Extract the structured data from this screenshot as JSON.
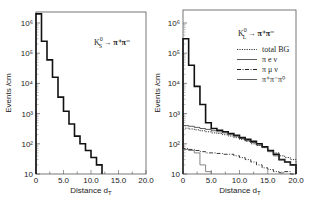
{
  "chart_data": [
    {
      "type": "bar",
      "style": "step-histogram",
      "title": "K_S^0 → π+π−",
      "xlabel": "Distance d_T",
      "ylabel": "Events /cm",
      "yscale": "log",
      "xlim": [
        0,
        20.0
      ],
      "ylim": [
        10,
        2000000
      ],
      "xticks": [
        "0",
        "5.0",
        "10.0",
        "15.0",
        "20.0"
      ],
      "yticks": [
        "10",
        "10^2",
        "10^3",
        "10^4",
        "10^5",
        "10^6"
      ],
      "bin_width": 1.0,
      "series": [
        {
          "name": "K_S^0 → π+π−",
          "style": "thick-solid",
          "x": [
            0,
            1,
            2,
            3,
            4,
            5,
            6,
            7,
            8,
            9,
            10,
            11
          ],
          "values": [
            2000000,
            250000,
            60000,
            16000,
            3500,
            1200,
            450,
            180,
            100,
            60,
            35,
            20
          ]
        }
      ],
      "legend": [],
      "grid": false
    },
    {
      "type": "bar",
      "style": "step-histogram",
      "title": "K_L^0 → π+π−",
      "xlabel": "Distance d_T",
      "ylabel": "Events /cm",
      "yscale": "log",
      "xlim": [
        0,
        20.0
      ],
      "ylim": [
        10,
        2000000
      ],
      "xticks": [
        "0",
        "5.0",
        "10.0",
        "15.0",
        "20.0"
      ],
      "yticks": [
        "10",
        "10^2",
        "10^3",
        "10^4",
        "10^5",
        "10^6"
      ],
      "bin_width": 1.0,
      "series": [
        {
          "name": "K_L^0 → π+π− (signal+BG)",
          "style": "thick-solid",
          "x": [
            0,
            1,
            2,
            3,
            4,
            5,
            6,
            7,
            8,
            9,
            10,
            11,
            12,
            13,
            14,
            15,
            16,
            17,
            18,
            19
          ],
          "values": [
            300000,
            40000,
            8000,
            2000,
            500,
            320,
            280,
            250,
            220,
            190,
            160,
            140,
            120,
            100,
            80,
            60,
            45,
            30,
            25,
            20
          ]
        },
        {
          "name": "total BG",
          "style": "dotted",
          "x": [
            0,
            1,
            2,
            3,
            4,
            5,
            6,
            7,
            8,
            9,
            10,
            11,
            12,
            13,
            14,
            15,
            16,
            17,
            18,
            19
          ],
          "values": [
            330,
            310,
            290,
            270,
            250,
            230,
            220,
            200,
            180,
            160,
            140,
            120,
            100,
            90,
            75,
            60,
            50,
            40,
            35,
            30
          ]
        },
        {
          "name": "π e ν",
          "style": "thin-solid",
          "x": [
            0,
            1,
            2,
            3,
            4,
            5,
            6,
            7,
            8,
            9,
            10,
            11,
            12,
            13,
            14,
            15,
            16,
            17,
            18,
            19
          ],
          "values": [
            400,
            380,
            350,
            320,
            300,
            270,
            250,
            230,
            200,
            180,
            150,
            130,
            110,
            90,
            75,
            55,
            40,
            30,
            25,
            20
          ]
        },
        {
          "name": "π μ ν",
          "style": "dash-dot",
          "x": [
            0,
            1,
            2,
            3,
            4,
            5,
            6,
            7,
            8,
            9,
            10,
            11,
            12,
            13,
            14,
            15,
            16,
            17,
            18,
            19
          ],
          "values": [
            70,
            65,
            60,
            55,
            50,
            50,
            48,
            45,
            45,
            40,
            35,
            30,
            25,
            20,
            16,
            14,
            12,
            11,
            12,
            10
          ]
        },
        {
          "name": "π+π−π0",
          "style": "thin-solid-gray",
          "x": [
            0,
            1,
            2,
            3,
            4
          ],
          "values": [
            65,
            60,
            50,
            20,
            12
          ]
        }
      ],
      "legend": [
        "total BG",
        "π e ν",
        "π μ ν",
        "π+π−π0"
      ],
      "legend_position": "upper right",
      "grid": false
    }
  ],
  "left_chart": {
    "title_main": "K",
    "title_sup": "0",
    "title_sub": "S",
    "title_decay": "→ π⁺π⁻",
    "xlabel": "Distance d",
    "xlabel_sub": "T",
    "ylabel": "Events /cm",
    "xticks": [
      "0",
      "5.0",
      "10.0",
      "15.0",
      "20.0"
    ],
    "yticks": [
      "10",
      "10²",
      "10³",
      "10⁴",
      "10⁵",
      "10⁶"
    ]
  },
  "right_chart": {
    "title_main": "K",
    "title_sup": "0",
    "title_sub": "L",
    "title_decay": "→ π⁺π⁻",
    "xlabel": "Distance d",
    "xlabel_sub": "T",
    "ylabel": "Events /cm",
    "xticks": [
      "0",
      "5.0",
      "10.0",
      "15.0",
      "20.0"
    ],
    "yticks": [
      "10",
      "10²",
      "10³",
      "10⁴",
      "10⁵",
      "10⁶"
    ],
    "legend": [
      {
        "label": "total BG",
        "style": "dotted"
      },
      {
        "label": "π e ν",
        "style": "solid"
      },
      {
        "label": "π μ ν",
        "style": "dashdot"
      },
      {
        "label": "π⁺π⁻π⁰",
        "style": "solid"
      }
    ]
  }
}
